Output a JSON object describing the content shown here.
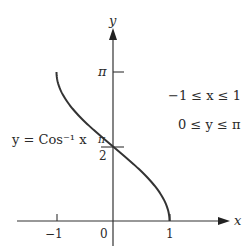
{
  "diagram": {
    "axes": {
      "x_label": "x",
      "y_label": "y",
      "x_ticks": [
        {
          "value": -1,
          "label": "−1"
        },
        {
          "value": 0,
          "label": "0"
        },
        {
          "value": 1,
          "label": "1"
        }
      ],
      "y_ticks": [
        {
          "value": "pi",
          "label": "π"
        },
        {
          "value": "pi/2",
          "numerator": "π",
          "denominator": "2"
        }
      ]
    },
    "curve": {
      "label": "y = Cos⁻¹ x",
      "function": "arccos(x)",
      "domain": [
        -1,
        1
      ],
      "range": [
        0,
        3.14159
      ],
      "color": "#333333"
    },
    "annotations": {
      "domain_text": "−1 ≤ x ≤ 1",
      "range_text": "0 ≤ y ≤ π"
    },
    "colors": {
      "line": "#333333",
      "text": "#2a2a2a",
      "background": "#ffffff"
    }
  }
}
